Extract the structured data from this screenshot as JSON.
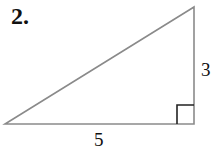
{
  "problem": {
    "number": "2."
  },
  "triangle": {
    "type": "right triangle",
    "vertices": {
      "left": [
        5,
        124
      ],
      "right_angle": [
        194,
        124
      ],
      "top": [
        194,
        7
      ]
    },
    "sides": {
      "base_label": "5",
      "height_label": "3"
    },
    "right_angle_marker": true,
    "line_color": "#8a8a8a",
    "marker_color": "#222222"
  }
}
